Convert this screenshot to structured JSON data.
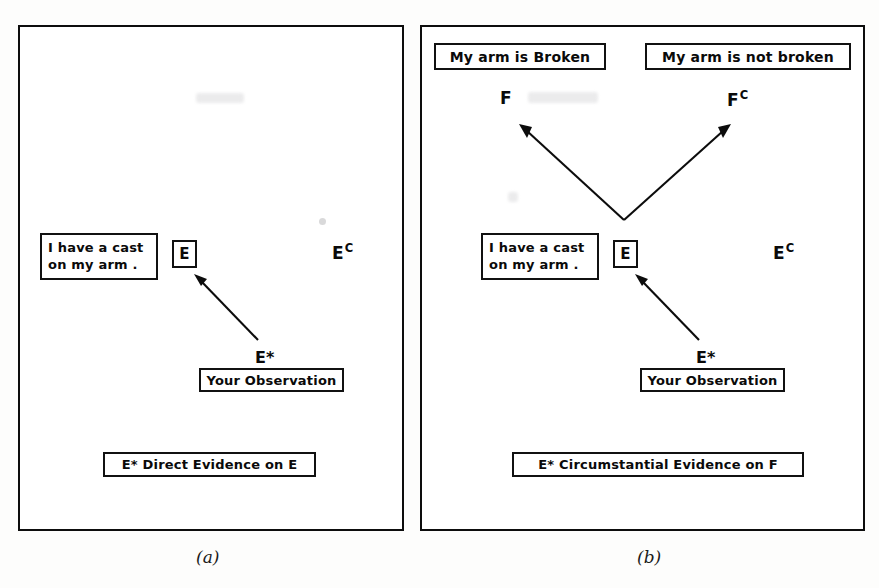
{
  "figure": {
    "panels": [
      {
        "id": "a",
        "caption": "(a)",
        "boxes": {
          "evidence_statement_line1": "I have a cast",
          "evidence_statement_line2": "on my arm .",
          "event_symbol": "E",
          "observation": "Your Observation",
          "footer": "E* Direct Evidence on E"
        },
        "labels": {
          "complement_event": "E",
          "complement_event_sup": "C",
          "observation_symbol": "E*"
        }
      },
      {
        "id": "b",
        "caption": "(b)",
        "boxes": {
          "hypothesis_true": "My arm is Broken",
          "hypothesis_false": "My arm is not broken",
          "evidence_statement_line1": "I have a cast",
          "evidence_statement_line2": "on my arm .",
          "event_symbol": "E",
          "observation": "Your Observation",
          "footer": "E* Circumstantial Evidence on F"
        },
        "labels": {
          "hypothesis_true_symbol": "F",
          "hypothesis_false_symbol": "F",
          "hypothesis_false_sup": "C",
          "complement_event": "E",
          "complement_event_sup": "C",
          "observation_symbol": "E*"
        }
      }
    ]
  },
  "colors": {
    "ink": "#0c0c0c",
    "paper": "#ffffff",
    "page": "#fdfdfc"
  }
}
